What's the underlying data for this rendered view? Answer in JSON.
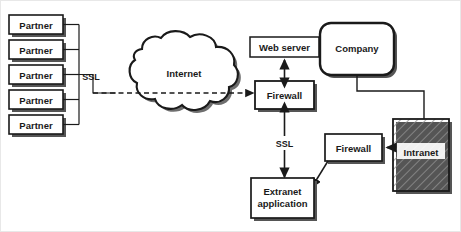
{
  "diagram": {
    "colors": {
      "stroke": "#1a1a1a",
      "fill": "#ffffff",
      "shadow": "#555555",
      "hatch": "#8a8a8a",
      "frame": "#e8e8e8"
    },
    "partners": [
      {
        "label": "Partner"
      },
      {
        "label": "Partner"
      },
      {
        "label": "Partner"
      },
      {
        "label": "Partner"
      },
      {
        "label": "Partner"
      }
    ],
    "nodes": {
      "internet": {
        "label": "Internet",
        "shape": "cloud"
      },
      "web_server": {
        "label": "Web server",
        "shape": "rect"
      },
      "firewall_outer": {
        "label": "Firewall",
        "shape": "rect-shadow"
      },
      "company": {
        "label": "Company",
        "shape": "rounded-rect"
      },
      "firewall_inner": {
        "label": "Firewall",
        "shape": "rect-shadow"
      },
      "intranet": {
        "label": "Intranet",
        "shape": "hatched-rect"
      },
      "extranet_application": {
        "label_line1": "Extranet",
        "label_line2": "application",
        "shape": "rect-shadow"
      }
    },
    "edge_labels": {
      "ssl_partners": "SSL",
      "ssl_extranet": "SSL"
    }
  }
}
